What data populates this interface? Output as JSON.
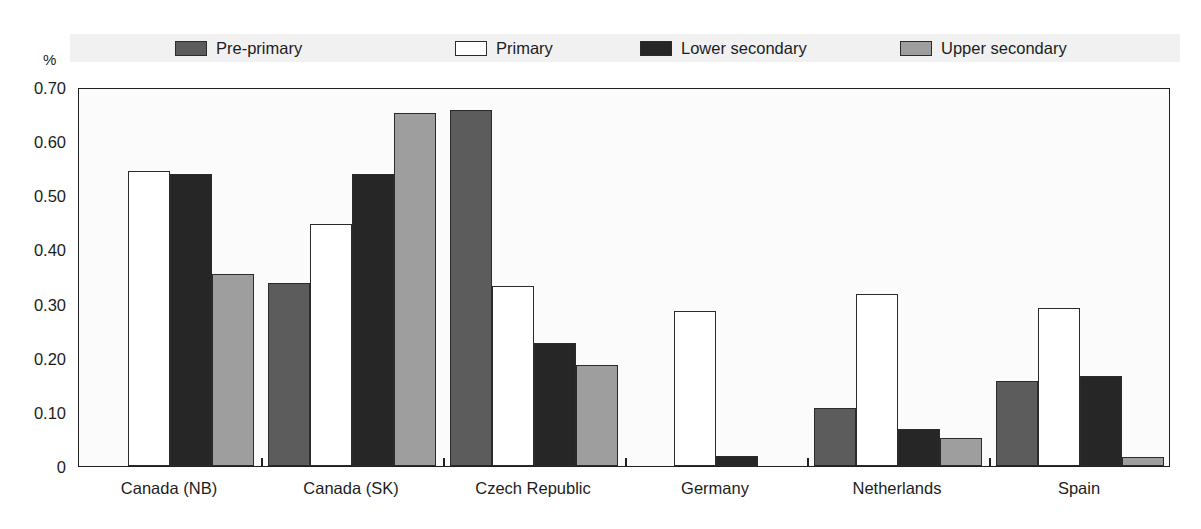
{
  "chart_data": {
    "type": "bar",
    "title": "",
    "subtitle": "",
    "xlabel": "",
    "ylabel": "%",
    "ylim": [
      0,
      0.7
    ],
    "ytick_labels": [
      "0.70",
      "0.60",
      "0.50",
      "0.40",
      "0.30",
      "0.20",
      "0.10",
      "0"
    ],
    "ytick_values": [
      0.7,
      0.6,
      0.5,
      0.4,
      0.3,
      0.2,
      0.1,
      0
    ],
    "grid": false,
    "legend_position": "top",
    "categories": [
      "Canada (NB)",
      "Canada (SK)",
      "Czech Republic",
      "Germany",
      "Netherlands",
      "Spain"
    ],
    "series": [
      {
        "name": "Pre-primary",
        "color": "#5c5c5c",
        "values": [
          0.0,
          0.338,
          0.658,
          0.0,
          0.108,
          0.157
        ]
      },
      {
        "name": "Primary",
        "color": "#ffffff",
        "values": [
          0.545,
          0.447,
          0.332,
          0.287,
          0.318,
          0.291
        ]
      },
      {
        "name": "Lower secondary",
        "color": "#262626",
        "values": [
          0.54,
          0.54,
          0.228,
          0.019,
          0.069,
          0.167
        ]
      },
      {
        "name": "Upper secondary",
        "color": "#9e9e9e",
        "values": [
          0.355,
          0.652,
          0.186,
          0.0,
          0.052,
          0.017
        ]
      }
    ]
  },
  "axes": {
    "y_unit_label": "%"
  },
  "colors": {
    "axis": "#1f1f1f",
    "legend_band": "#f1f1f1",
    "plot_background": "#fbfbfb",
    "bar_outline": "#2b2b2b"
  }
}
